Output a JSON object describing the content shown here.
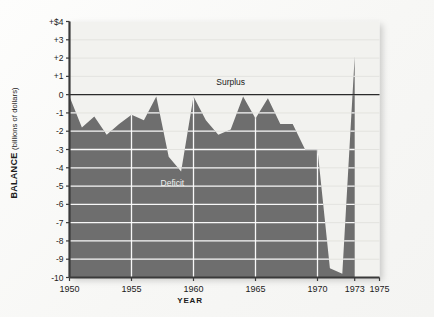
{
  "figure": {
    "background_color": "#f8f8f6",
    "plot_background_color": "#f2f2ef",
    "series_fill_color": "#6e6e6e",
    "gridline_color": "#ffffff",
    "axis_color": "#3a3a3a"
  },
  "labels": {
    "y_axis_title_main": "BALANCE",
    "y_axis_title_units": "(billions of dollars)",
    "x_axis_title": "YEAR"
  },
  "annotations": [
    {
      "name": "surplus-label",
      "text": "Surplus",
      "x_year": 1963.0,
      "y_value": 0.55
    },
    {
      "name": "deficit-label",
      "text": "Deficit",
      "x_year": 1958.3,
      "y_value": -5.0
    }
  ],
  "chart_data": {
    "type": "area",
    "title": "",
    "subtitle": "",
    "xlabel": "YEAR",
    "ylabel": "BALANCE (billions of dollars)",
    "xlim": [
      1950,
      1975
    ],
    "ylim": [
      -10,
      4
    ],
    "grid": true,
    "grid_axis": "y",
    "legend": null,
    "baseline": -10,
    "zero_reference_line": 0,
    "y_ticks": [
      4,
      3,
      2,
      1,
      0,
      -1,
      -2,
      -3,
      -4,
      -5,
      -6,
      -7,
      -8,
      -9,
      -10
    ],
    "y_tick_labels": [
      "+$4",
      "+3",
      "+2",
      "+1",
      "0",
      "-1",
      "-2",
      "-3",
      "-4",
      "-5",
      "-6",
      "-7",
      "-8",
      "-9",
      "-10"
    ],
    "x_ticks": [
      1950,
      1955,
      1960,
      1965,
      1970,
      1973,
      1975
    ],
    "x_tick_labels": [
      "1950",
      "1955",
      "1960",
      "1965",
      "1970",
      "1973",
      "1975"
    ],
    "series": [
      {
        "name": "Balance of payments",
        "x": [
          1950,
          1951,
          1952,
          1953,
          1954,
          1955,
          1956,
          1957,
          1958,
          1959,
          1960,
          1961,
          1962,
          1963,
          1964,
          1965,
          1966,
          1967,
          1968,
          1969,
          1970,
          1971,
          1972,
          1973
        ],
        "values": [
          -0.1,
          -1.8,
          -1.2,
          -2.2,
          -1.6,
          -1.1,
          -1.4,
          -0.1,
          -3.4,
          -4.2,
          -0.1,
          -1.4,
          -2.2,
          -1.9,
          -0.1,
          -1.3,
          -0.2,
          -1.6,
          -1.6,
          -3.0,
          -3.0,
          -9.5,
          -9.8,
          2.1
        ]
      }
    ]
  }
}
